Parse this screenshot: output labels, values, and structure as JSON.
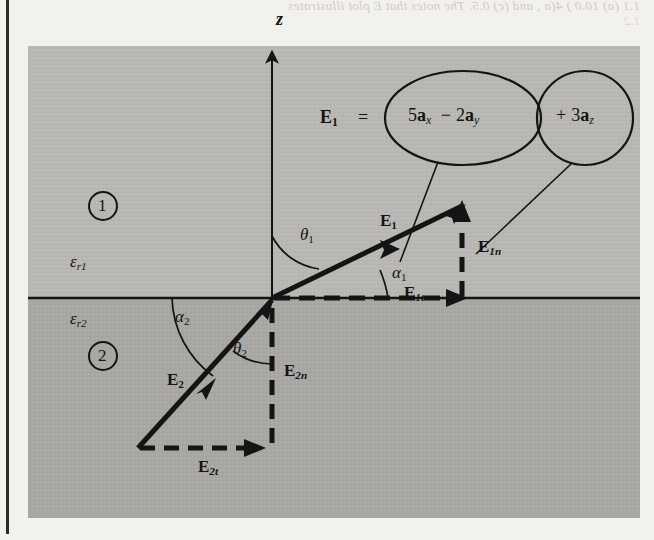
{
  "page": {
    "bleed_line1": "1.1 (a) 10.0 ) 4(a , and (c) 0.5. The notes that E  plot illustrates",
    "bleed_line2": "1.2"
  },
  "figure": {
    "axis": {
      "z_label": "z"
    },
    "regions": [
      {
        "number": "1",
        "permittivity_symbol": "ε",
        "permittivity_sub": "r1"
      },
      {
        "number": "2",
        "permittivity_symbol": "ε",
        "permittivity_sub": "r2"
      }
    ],
    "vectors": [
      {
        "name": "E1",
        "base": "E",
        "sub": "1",
        "desc": "incident-field-region-1"
      },
      {
        "name": "E1t",
        "base": "E",
        "sub": "1t",
        "desc": "tangential-component-region-1"
      },
      {
        "name": "E1n",
        "base": "E",
        "sub": "1n",
        "desc": "normal-component-region-1"
      },
      {
        "name": "E2",
        "base": "E",
        "sub": "2",
        "desc": "refracted-field-region-2"
      },
      {
        "name": "E2t",
        "base": "E",
        "sub": "2t",
        "desc": "tangential-component-region-2"
      },
      {
        "name": "E2n",
        "base": "E",
        "sub": "2n",
        "desc": "normal-component-region-2"
      }
    ],
    "angles": [
      {
        "name": "theta1",
        "symbol": "θ",
        "sub": "1"
      },
      {
        "name": "alpha1",
        "symbol": "α",
        "sub": "1"
      },
      {
        "name": "alpha2",
        "symbol": "α",
        "sub": "2"
      },
      {
        "name": "theta2",
        "symbol": "θ",
        "sub": "2"
      }
    ],
    "callout": {
      "lead_base": "E",
      "lead_sub": "1",
      "equals": "=",
      "bubble_tangential": {
        "coef1": "5",
        "unit1": "a",
        "unit1_sub": "x",
        "operator": "−",
        "coef2": "2",
        "unit2": "a",
        "unit2_sub": "y"
      },
      "bubble_normal": {
        "operator": "+",
        "coef": "3",
        "unit": "a",
        "unit_sub": "z"
      }
    },
    "colors": {
      "region1_fill": "#b9b7b4",
      "region2_fill": "#a9a7a4",
      "ink": "#141414",
      "page_bg": "#f3f1ee"
    }
  }
}
